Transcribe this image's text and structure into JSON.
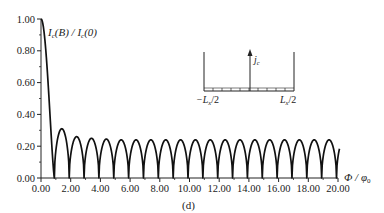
{
  "chart_data": {
    "type": "line",
    "title": "",
    "panel_label": "(d)",
    "xlabel": "Φ/φ0",
    "ylabel": "Ic(B) / Ic(0)",
    "xlim": [
      0,
      20
    ],
    "ylim": [
      0,
      1
    ],
    "x_ticks": [
      "0.00",
      "2.00",
      "4.00",
      "6.00",
      "8.00",
      "10.00",
      "12.00",
      "14.00",
      "16.00",
      "18.00",
      "20.00"
    ],
    "y_ticks": [
      "0.00",
      "0.20",
      "0.40",
      "0.60",
      "0.80",
      "1.00"
    ],
    "grid": false,
    "series": [
      {
        "name": "Ic(B)/Ic(0)",
        "description": "Main lobe falls from 1.00 at Φ=0 to zero near Φ≈0.9; then periodic arch-shaped lobes with period ≈1 Φ0, zeros near integer+0.9",
        "x": [
          0.0,
          0.3,
          0.6,
          0.9,
          1.4,
          1.9,
          2.4,
          2.9,
          3.4,
          3.9,
          4.4,
          4.9,
          6.9,
          9.9,
          14.9,
          19.9,
          20.1
        ],
        "values": [
          1.0,
          0.85,
          0.45,
          0.0,
          0.31,
          0.0,
          0.26,
          0.0,
          0.25,
          0.0,
          0.245,
          0.0,
          0.0,
          0.0,
          0.0,
          0.0,
          0.17
        ],
        "lobe_peaks": [
          0.31,
          0.26,
          0.25,
          0.245,
          0.24,
          0.24,
          0.24,
          0.24,
          0.24,
          0.24,
          0.24,
          0.24,
          0.24,
          0.24,
          0.24,
          0.24,
          0.24,
          0.24,
          0.24
        ]
      }
    ],
    "inset": {
      "description": "Current density profile jc(x): peaks at both edges, flat near zero in the middle",
      "ylabel": "jc",
      "x_left_label": "−Lx/2",
      "x_right_label": "Lx/2"
    }
  },
  "labels": {
    "ylabel_main": "I",
    "ylabel_sub": "c",
    "ylabel_rest": "(B) / I",
    "ylabel_sub2": "c",
    "ylabel_end": "(0)",
    "xlabel_main": "Φ / φ",
    "xlabel_sub": "0",
    "panel": "(d)",
    "inset_j": "j",
    "inset_j_sub": "c",
    "inset_left": "−L",
    "inset_left_sub": "x",
    "inset_left_end": "/2",
    "inset_right": "L",
    "inset_right_sub": "x",
    "inset_right_end": "/2"
  }
}
